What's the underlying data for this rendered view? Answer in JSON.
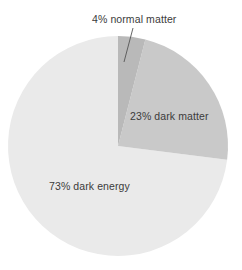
{
  "chart_data": {
    "type": "pie",
    "title": "",
    "categories": [
      "normal matter",
      "dark matter",
      "dark energy"
    ],
    "values": [
      4,
      23,
      73
    ],
    "unit": "%",
    "labels": [
      "4% normal matter",
      "23% dark matter",
      "73% dark energy"
    ],
    "colors": [
      "#b9b9b9",
      "#c9c9c9",
      "#eaeaea"
    ],
    "legend": "none",
    "grid": false,
    "start_angle_deg": 0,
    "direction": "clockwise",
    "annotations": [
      {
        "text": "4% normal matter",
        "target_slice": "normal matter",
        "leader_line": true
      }
    ]
  },
  "labels": {
    "normal_matter": "4% normal matter",
    "dark_matter": "23% dark matter",
    "dark_energy": "73% dark energy"
  },
  "colors": {
    "normal_matter": "#b9b9b9",
    "dark_matter": "#c9c9c9",
    "dark_energy": "#eaeaea",
    "text": "#3b3b3b",
    "leader_line": "#555555",
    "background": "#ffffff"
  }
}
